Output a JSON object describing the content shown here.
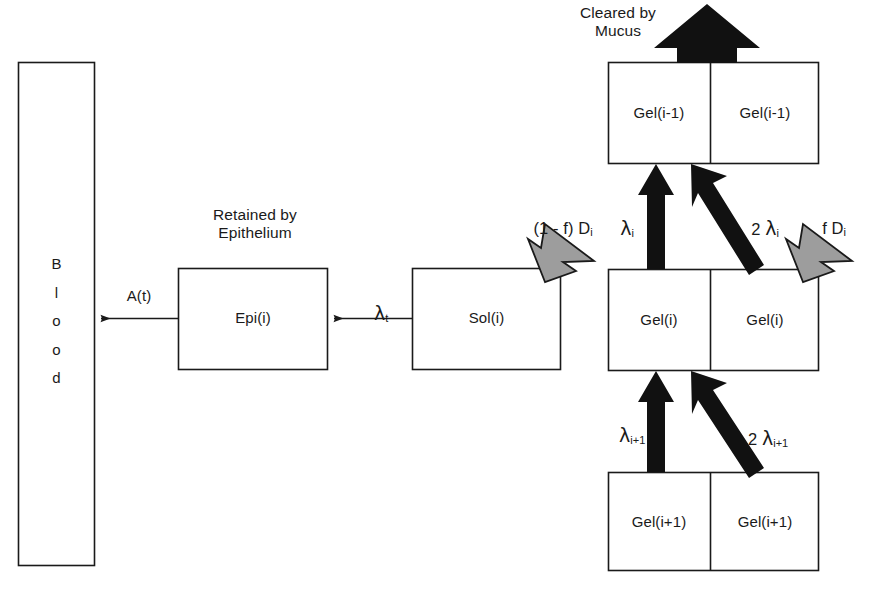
{
  "diagram": {
    "type": "flow-diagram",
    "colors": {
      "stroke": "#1a1a1a",
      "box_fill": "#ffffff",
      "black_arrow": "#111111",
      "gray_arrow_fill": "#9d9d9d",
      "gray_arrow_stroke": "#1a1a1a",
      "text": "#1a1a1a",
      "background": "#ffffff"
    }
  },
  "boxes": {
    "blood": {
      "letters": [
        "B",
        "l",
        "o",
        "o",
        "d"
      ],
      "label": "Blood"
    },
    "epi": {
      "label": "Epi(i)"
    },
    "sol": {
      "label": "Sol(i)"
    },
    "gel_above": {
      "left_label": "Gel(i-1)",
      "right_label": "Gel(i-1)"
    },
    "gel_current": {
      "left_label": "Gel(i)",
      "right_label": "Gel(i)"
    },
    "gel_below": {
      "left_label": "Gel(i+1)",
      "right_label": "Gel(i+1)"
    }
  },
  "captions": {
    "cleared_by_mucus": "Cleared by\nMucus",
    "retained_by_epithelium": "Retained by\nEpithelium"
  },
  "flow_labels": {
    "absorption": "A(t)",
    "sol_to_epi": "λ",
    "sol_to_epi_sub": "t",
    "deposition_sol_pre": "(1 - f) D",
    "deposition_sol_sub": "i",
    "deposition_gel_pre": "f D",
    "deposition_gel_sub": "i",
    "lambda_i_coef": "",
    "lambda_i": "λ",
    "lambda_i_sub": "i",
    "two_lambda_i_coef": "2 ",
    "two_lambda_i": "λ",
    "two_lambda_i_sub": "i",
    "lambda_ip1_coef": "",
    "lambda_ip1": "λ",
    "lambda_ip1_sub": "i+1",
    "two_lambda_ip1_coef": "2 ",
    "two_lambda_ip1": "λ",
    "two_lambda_ip1_sub": "i+1"
  },
  "arrow_names": {
    "mucus_clearance": "mucus-clearance-arrow",
    "epi_to_blood": "epi-to-blood-arrow",
    "sol_to_epi": "sol-to-epi-arrow",
    "deposition_to_sol": "deposition-to-sol-arrow",
    "deposition_to_gel": "deposition-to-gel-arrow",
    "gel_i_to_gel_im1_left": "gel-i-to-gel-im1-left-arrow",
    "gel_i_to_gel_im1_right": "gel-i-to-gel-im1-right-arrow",
    "gel_ip1_to_gel_i_left": "gel-ip1-to-gel-i-left-arrow",
    "gel_ip1_to_gel_i_right": "gel-ip1-to-gel-i-right-arrow"
  }
}
